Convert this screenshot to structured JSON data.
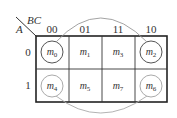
{
  "kmap": {
    "row_var": "A",
    "col_var": "BC",
    "col_headers": [
      "00",
      "01",
      "11",
      "10"
    ],
    "row_headers": [
      "0",
      "1"
    ],
    "cells": [
      [
        {
          "m": "m",
          "sub": "0",
          "circled": true
        },
        {
          "m": "m",
          "sub": "1",
          "circled": false
        },
        {
          "m": "m",
          "sub": "3",
          "circled": false
        },
        {
          "m": "m",
          "sub": "2",
          "circled": true
        }
      ],
      [
        {
          "m": "m",
          "sub": "4",
          "circled": true
        },
        {
          "m": "m",
          "sub": "5",
          "circled": false
        },
        {
          "m": "m",
          "sub": "7",
          "circled": false
        },
        {
          "m": "m",
          "sub": "6",
          "circled": true
        }
      ]
    ],
    "groupings": [
      "m0-m2 (top wrap arc)",
      "m4-m6 (bottom wrap arc)"
    ]
  }
}
